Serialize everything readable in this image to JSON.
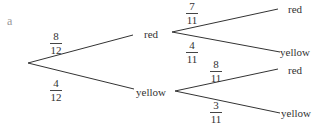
{
  "part_label": "a",
  "tree": {
    "root": {
      "branches": [
        {
          "label": "red",
          "prob": {
            "num": "8",
            "den": "12"
          },
          "branches": [
            {
              "label": "red",
              "prob": {
                "num": "7",
                "den": "11"
              }
            },
            {
              "label": "yellow",
              "prob": {
                "num": "4",
                "den": "11"
              }
            }
          ]
        },
        {
          "label": "yellow",
          "prob": {
            "num": "4",
            "den": "12"
          },
          "branches": [
            {
              "label": "red",
              "prob": {
                "num": "8",
                "den": "11"
              }
            },
            {
              "label": "yellow",
              "prob": {
                "num": "3",
                "den": "11"
              }
            }
          ]
        }
      ]
    }
  }
}
